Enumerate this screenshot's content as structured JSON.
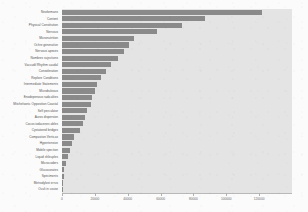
{
  "chart_data": {
    "type": "bar",
    "orientation": "horizontal",
    "title": "",
    "xlabel": "",
    "ylabel": "",
    "xlim": [
      0,
      140000
    ],
    "grid": false,
    "legend": null,
    "bar_color": "#8a8a8a",
    "plot_background": "#e4e4e4",
    "xticks": [
      0,
      20000,
      40000,
      60000,
      80000,
      100000,
      120000
    ],
    "xtick_labels": [
      "0",
      "20000",
      "40000",
      "60000",
      "80000",
      "100000",
      "120000"
    ],
    "categories": [
      "Neoformans",
      "Content",
      "Physical Constitution",
      "Nervous",
      "Micronutrition",
      "Ochre generative",
      "Nervous apexes",
      "Nombres sujections",
      "Vaccudil Rhythm caudal",
      "Consoleration",
      "Replore Conditions",
      "Intermediate Statements",
      "Microbuleous",
      "Enodepenous radicalites",
      "Mitchelsonic Opposition Coastal",
      "Self perculator",
      "Auros dispersion",
      "Cocos iodacenes ables",
      "Cystatored bridges",
      "Compastion Verticas",
      "Hypertensive",
      "Mobile spection",
      "Liquid shleuples",
      "Microcoders",
      "Glucocorates",
      "Speciments",
      "Metrodylost errus",
      "Oculi in couse"
    ],
    "values": [
      122000,
      87000,
      73000,
      58000,
      44000,
      41000,
      38000,
      34000,
      30000,
      26500,
      23500,
      21500,
      20000,
      18500,
      17500,
      15500,
      14000,
      12500,
      11000,
      7500,
      6000,
      5000,
      3800,
      2200,
      1500,
      1000,
      700,
      400
    ]
  },
  "axis": {
    "x_title": "",
    "y_title": ""
  }
}
